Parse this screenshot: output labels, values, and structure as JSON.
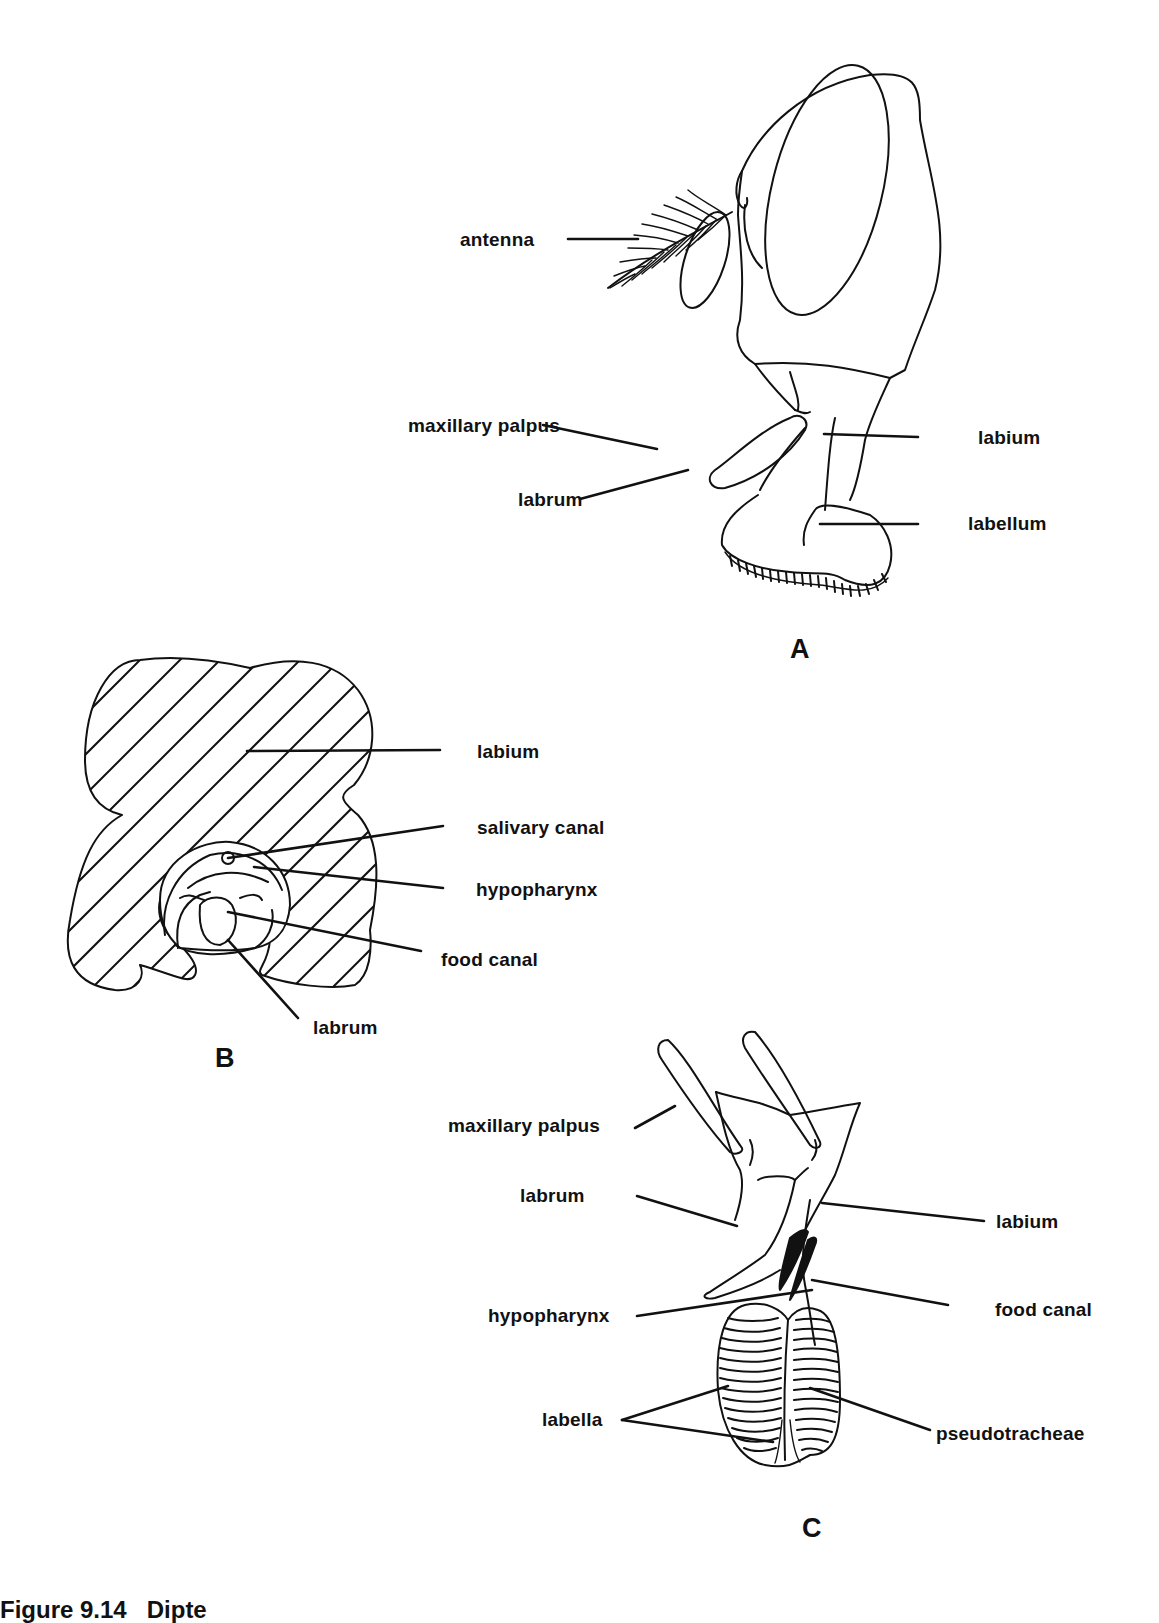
{
  "figure": {
    "caption_number": "Figure 9.14",
    "caption_text": "Dipte",
    "panels": {
      "A": {
        "label": "A",
        "title": "Fly head, lateral view",
        "labels": {
          "antenna": "antenna",
          "maxillary_palpus": "maxillary palpus",
          "labrum": "labrum",
          "labium": "labium",
          "labellum": "labellum"
        }
      },
      "B": {
        "label": "B",
        "title": "Proboscis cross-section",
        "labels": {
          "labium": "labium",
          "salivary_canal": "salivary canal",
          "hypopharynx": "hypopharynx",
          "food_canal": "food canal",
          "labrum": "labrum"
        }
      },
      "C": {
        "label": "C",
        "title": "Mouthparts, frontal view",
        "labels": {
          "maxillary_palpus": "maxillary palpus",
          "labrum": "labrum",
          "labium": "labium",
          "hypopharynx": "hypopharynx",
          "food_canal": "food canal",
          "labella": "labella",
          "pseudotracheae": "pseudotracheae"
        }
      }
    }
  },
  "colors": {
    "ink": "#111111",
    "paper": "#ffffff"
  }
}
